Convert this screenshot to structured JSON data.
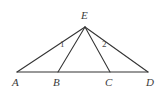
{
  "figure": {
    "type": "geometry-diagram",
    "background_color": "#ffffff",
    "stroke_color": "#333333",
    "label_color": "#3b3b3b",
    "width": 164,
    "height": 92,
    "points": [
      {
        "id": "E",
        "label": "E",
        "x": 85,
        "y": 27,
        "label_x": 81,
        "label_y": 10
      },
      {
        "id": "A",
        "label": "A",
        "x": 17,
        "y": 72,
        "label_x": 12,
        "label_y": 77
      },
      {
        "id": "B",
        "label": "B",
        "x": 58,
        "y": 72,
        "label_x": 53,
        "label_y": 77
      },
      {
        "id": "C",
        "label": "C",
        "x": 110,
        "y": 72,
        "label_x": 105,
        "label_y": 77
      },
      {
        "id": "D",
        "label": "D",
        "x": 148,
        "y": 72,
        "label_x": 146,
        "label_y": 77
      }
    ],
    "segments": [
      {
        "id": "AD",
        "from": "A",
        "to": "D",
        "x1": 17,
        "y1": 72,
        "x2": 148,
        "y2": 72
      },
      {
        "id": "EA",
        "from": "E",
        "to": "A",
        "x1": 85,
        "y1": 27,
        "x2": 17,
        "y2": 72
      },
      {
        "id": "EB",
        "from": "E",
        "to": "B",
        "x1": 85,
        "y1": 27,
        "x2": 58,
        "y2": 72
      },
      {
        "id": "EC",
        "from": "E",
        "to": "C",
        "x1": 85,
        "y1": 27,
        "x2": 110,
        "y2": 72
      },
      {
        "id": "ED",
        "from": "E",
        "to": "D",
        "x1": 85,
        "y1": 27,
        "x2": 148,
        "y2": 72
      }
    ],
    "angle_labels": [
      {
        "id": "angle-1",
        "label": "1",
        "x": 60,
        "y": 40
      },
      {
        "id": "angle-2",
        "label": "2",
        "x": 102,
        "y": 40
      }
    ]
  }
}
